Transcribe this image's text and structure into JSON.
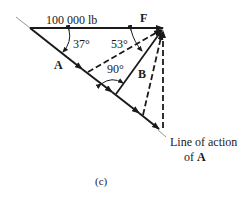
{
  "figure": {
    "force_label": "100 000 lb",
    "vector_F": "F",
    "vector_A": "A",
    "vector_B": "B",
    "angle_left": "37°",
    "angle_right": "53°",
    "angle_right_angle": "90°",
    "line_of_action_line1": "Line of action",
    "line_of_action_line2_prefix": "of ",
    "line_of_action_line2_bold": "A",
    "caption": "(c)"
  },
  "colors": {
    "ink": "#1a1a1a",
    "thin": "#777777",
    "background": "#ffffff"
  }
}
